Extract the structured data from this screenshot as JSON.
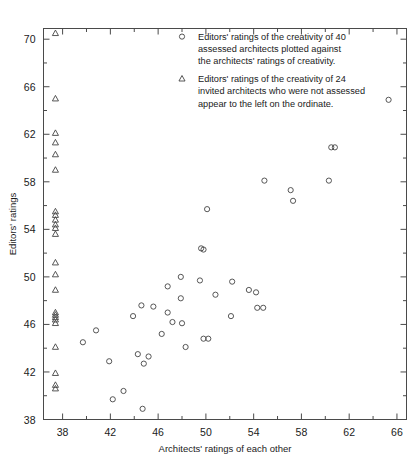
{
  "chart_data": {
    "type": "scatter",
    "title": "",
    "xlabel": "Architects' ratings of each other",
    "ylabel": "Editors' ratings",
    "xlim": [
      36.4,
      66.8
    ],
    "ylim": [
      38,
      70.9
    ],
    "xticks": [
      38,
      42,
      46,
      50,
      54,
      58,
      62,
      66
    ],
    "yticks": [
      38,
      42,
      46,
      50,
      54,
      58,
      62,
      66,
      70
    ],
    "xminor": [
      40,
      44,
      48,
      52,
      56,
      60,
      64
    ],
    "yminor": [
      40,
      44,
      48,
      52,
      56,
      60,
      64,
      68
    ],
    "grid": false,
    "legend_position": "upper-center-right",
    "series": [
      {
        "name": "assessed-architects",
        "marker": "circle",
        "legend_lines": [
          "Editors' ratings of the creativity of 40",
          "assessed architects plotted against",
          "the architects' ratings of creativity."
        ],
        "points": [
          [
            65.3,
            64.9
          ],
          [
            60.5,
            60.9
          ],
          [
            60.8,
            60.9
          ],
          [
            60.3,
            58.1
          ],
          [
            54.9,
            58.1
          ],
          [
            57.1,
            57.3
          ],
          [
            57.3,
            56.4
          ],
          [
            50.1,
            55.7
          ],
          [
            49.6,
            52.4
          ],
          [
            49.8,
            52.3
          ],
          [
            47.9,
            50.0
          ],
          [
            49.5,
            49.7
          ],
          [
            52.2,
            49.6
          ],
          [
            46.8,
            49.2
          ],
          [
            53.6,
            48.9
          ],
          [
            54.2,
            48.7
          ],
          [
            50.8,
            48.5
          ],
          [
            47.9,
            48.2
          ],
          [
            44.6,
            47.6
          ],
          [
            45.6,
            47.5
          ],
          [
            54.3,
            47.4
          ],
          [
            54.8,
            47.4
          ],
          [
            46.8,
            47.0
          ],
          [
            52.1,
            46.7
          ],
          [
            43.9,
            46.7
          ],
          [
            47.2,
            46.2
          ],
          [
            48.0,
            46.1
          ],
          [
            40.8,
            45.5
          ],
          [
            46.3,
            45.2
          ],
          [
            49.8,
            44.8
          ],
          [
            50.2,
            44.8
          ],
          [
            39.7,
            44.5
          ],
          [
            48.3,
            44.1
          ],
          [
            44.3,
            43.5
          ],
          [
            45.2,
            43.3
          ],
          [
            41.9,
            42.9
          ],
          [
            44.8,
            42.7
          ],
          [
            43.1,
            40.4
          ],
          [
            42.2,
            39.7
          ],
          [
            44.7,
            38.9
          ]
        ]
      },
      {
        "name": "invited-architects",
        "marker": "triangle",
        "legend_lines": [
          "Editors' ratings of the creativity of 24",
          "invited architects who were not assessed",
          "appear to the left on the ordinate."
        ],
        "x_position": 37.4,
        "values": [
          70.5,
          65.0,
          62.1,
          61.3,
          60.3,
          59.0,
          55.5,
          55.2,
          54.8,
          54.4,
          54.1,
          53.6,
          51.2,
          50.2,
          48.9,
          47.0,
          46.8,
          46.6,
          46.4,
          46.1,
          44.1,
          41.9,
          40.9,
          40.6
        ]
      }
    ]
  }
}
